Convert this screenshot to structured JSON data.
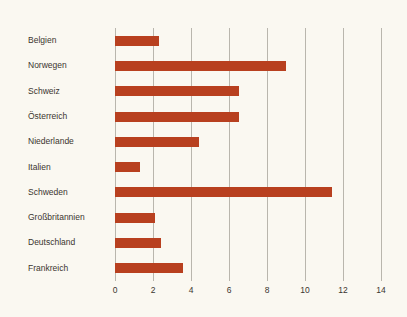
{
  "chart_data": {
    "type": "bar",
    "orientation": "horizontal",
    "title": "",
    "subtitle": "",
    "xlabel": "",
    "ylabel": "",
    "categories": [
      "Belgien",
      "Norwegen",
      "Schweiz",
      "Österreich",
      "Niederlande",
      "Italien",
      "Schweden",
      "Großbritannien",
      "Deutschland",
      "Frankreich"
    ],
    "values": [
      2.3,
      9.0,
      6.5,
      6.5,
      4.4,
      1.3,
      11.4,
      2.1,
      2.4,
      3.6
    ],
    "series": [
      {
        "name": "",
        "values": [
          2.3,
          9.0,
          6.5,
          6.5,
          4.4,
          1.3,
          11.4,
          2.1,
          2.4,
          3.6
        ]
      }
    ],
    "xticks": [
      0,
      2,
      4,
      6,
      8,
      10,
      12,
      14
    ],
    "xticklabels": [
      "0",
      "2",
      "4",
      "6",
      "8",
      "10",
      "12",
      "14"
    ],
    "xlim": [
      0,
      14
    ],
    "grid": "vertical",
    "legend": "none",
    "bar_color": "#b8401f",
    "background_color": "#faf8f1",
    "gridline_color": "#b9b6ad",
    "text_color": "#3a352f"
  }
}
